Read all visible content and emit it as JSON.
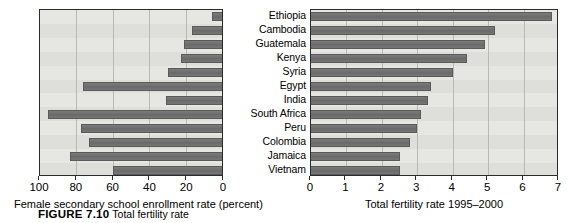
{
  "figure": {
    "caption_label": "FIGURE 7.10",
    "caption_text": "Total fertility rate"
  },
  "chart_data": [
    {
      "type": "bar",
      "orientation": "horizontal",
      "title": "",
      "xlabel": "Female secondary school enrollment rate (percent)",
      "ylabel": "",
      "xlim": [
        100,
        0
      ],
      "reversed_axis": true,
      "grid": true,
      "legend": false,
      "xticks": [
        100,
        80,
        60,
        40,
        20,
        0
      ],
      "xticklabels": [
        "100",
        "80",
        "60",
        "40",
        "20",
        "0"
      ],
      "categories": [
        "Ethiopia",
        "Cambodia",
        "Guatemala",
        "Kenya",
        "Syria",
        "Egypt",
        "India",
        "South Africa",
        "Peru",
        "Colombia",
        "Jamaica",
        "Vietnam"
      ],
      "values": [
        6,
        17,
        21,
        23,
        30,
        76,
        31,
        95,
        77,
        73,
        83,
        60
      ]
    },
    {
      "type": "bar",
      "orientation": "horizontal",
      "title": "",
      "xlabel": "Total fertility rate 1995–2000",
      "ylabel": "",
      "xlim": [
        0,
        7
      ],
      "reversed_axis": false,
      "grid": true,
      "legend": false,
      "xticks": [
        0,
        1,
        2,
        3,
        4,
        5,
        6,
        7
      ],
      "xticklabels": [
        "0",
        "1",
        "2",
        "3",
        "4",
        "5",
        "6",
        "7"
      ],
      "categories": [
        "Ethiopia",
        "Cambodia",
        "Guatemala",
        "Kenya",
        "Syria",
        "Egypt",
        "India",
        "South Africa",
        "Peru",
        "Colombia",
        "Jamaica",
        "Vietnam"
      ],
      "values": [
        6.8,
        5.2,
        4.9,
        4.4,
        4.0,
        3.4,
        3.3,
        3.1,
        3.0,
        2.8,
        2.5,
        2.5
      ]
    }
  ],
  "left_chart": {
    "axis_title": "Female secondary school enrollment rate (percent)",
    "ticks": [
      "100",
      "80",
      "60",
      "40",
      "20",
      "0"
    ]
  },
  "right_chart": {
    "axis_title": "Total fertility rate 1995–2000",
    "ticks": [
      "0",
      "1",
      "2",
      "3",
      "4",
      "5",
      "6",
      "7"
    ]
  },
  "countries": [
    "Ethiopia",
    "Cambodia",
    "Guatemala",
    "Kenya",
    "Syria",
    "Egypt",
    "India",
    "South Africa",
    "Peru",
    "Colombia",
    "Jamaica",
    "Vietnam"
  ]
}
